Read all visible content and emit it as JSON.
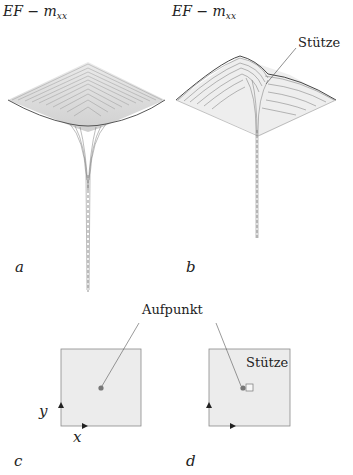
{
  "panels": {
    "a": {
      "title_main": "EF − m",
      "title_sub": "xx",
      "letter": "a"
    },
    "b": {
      "title_main": "EF − m",
      "title_sub": "xx",
      "letter": "b",
      "callout": "Stütze"
    },
    "c": {
      "letter": "c",
      "axis_x": "x",
      "axis_y": "y"
    },
    "d": {
      "letter": "d",
      "callout": "Stütze"
    }
  },
  "shared": {
    "aufpunkt_label": "Aufpunkt"
  },
  "colors": {
    "mesh": "#555555",
    "plate_fill": "#e9e9e9",
    "plate_border": "#8a8a8a",
    "marker": "#777777",
    "text": "#222222"
  }
}
